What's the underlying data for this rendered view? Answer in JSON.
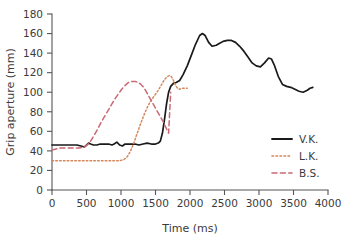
{
  "chart_data": {
    "type": "line",
    "title": "",
    "xlabel": "Time (ms)",
    "ylabel": "Grip aperture (mm)",
    "xlim": [
      0,
      4000
    ],
    "ylim": [
      0,
      180
    ],
    "xticks": [
      0,
      500,
      1000,
      1500,
      2000,
      2500,
      3000,
      3500,
      4000
    ],
    "yticks": [
      0,
      20,
      40,
      60,
      80,
      100,
      120,
      140,
      160,
      180
    ],
    "grid": false,
    "legend_position": "lower right",
    "series": [
      {
        "name": "V.K.",
        "color": "#1a1a1a",
        "style": "solid",
        "x": [
          0,
          60,
          120,
          200,
          280,
          360,
          420,
          470,
          500,
          530,
          560,
          600,
          650,
          700,
          760,
          820,
          870,
          900,
          940,
          980,
          1020,
          1060,
          1100,
          1150,
          1200,
          1260,
          1320,
          1380,
          1440,
          1500,
          1540,
          1570,
          1600,
          1630,
          1660,
          1690,
          1720,
          1760,
          1800,
          1850,
          1900,
          1960,
          2020,
          2080,
          2140,
          2180,
          2220,
          2270,
          2320,
          2380,
          2430,
          2480,
          2540,
          2600,
          2660,
          2720,
          2780,
          2840,
          2900,
          2960,
          3020,
          3080,
          3140,
          3180,
          3220,
          3280,
          3340,
          3400,
          3460,
          3520,
          3580,
          3640,
          3700,
          3740,
          3780
        ],
        "y": [
          46,
          46,
          46,
          46,
          46,
          46,
          45,
          44,
          46,
          48,
          47,
          46,
          46,
          47,
          47,
          47,
          46,
          47,
          49,
          46,
          45,
          47,
          47,
          47,
          47,
          46,
          47,
          48,
          47,
          47,
          48,
          50,
          58,
          72,
          88,
          100,
          106,
          109,
          110,
          112,
          118,
          127,
          138,
          149,
          158,
          160,
          158,
          151,
          147,
          148,
          150,
          152,
          153,
          153,
          151,
          147,
          142,
          136,
          130,
          127,
          126,
          130,
          135,
          134,
          128,
          116,
          108,
          106,
          105,
          103,
          101,
          100,
          102,
          104,
          105
        ]
      },
      {
        "name": "L.K.",
        "color": "#d4885c",
        "style": "dotted",
        "x": [
          0,
          100,
          200,
          300,
          400,
          500,
          600,
          700,
          800,
          900,
          980,
          1040,
          1090,
          1140,
          1190,
          1240,
          1290,
          1340,
          1390,
          1440,
          1490,
          1540,
          1590,
          1630,
          1670,
          1700,
          1730,
          1760,
          1790,
          1820,
          1850,
          1880,
          1910,
          1940,
          1960
        ],
        "y": [
          30,
          30,
          30,
          30,
          30,
          30,
          30,
          30,
          30,
          30,
          30,
          31,
          34,
          40,
          49,
          59,
          69,
          78,
          86,
          92,
          97,
          102,
          108,
          113,
          116,
          117,
          116,
          112,
          107,
          104,
          103,
          104,
          104,
          104,
          104
        ]
      },
      {
        "name": "B.S.",
        "color": "#c96a74",
        "style": "dashed",
        "x": [
          0,
          60,
          120,
          190,
          260,
          330,
          400,
          460,
          510,
          560,
          610,
          660,
          710,
          760,
          810,
          860,
          910,
          960,
          1010,
          1060,
          1110,
          1160,
          1210,
          1250,
          1290,
          1330,
          1370,
          1410,
          1450,
          1490,
          1530,
          1570,
          1610,
          1650,
          1690,
          1720
        ],
        "y": [
          41,
          42,
          43,
          43,
          43,
          43,
          43,
          44,
          46,
          50,
          56,
          62,
          69,
          75,
          81,
          87,
          93,
          98,
          103,
          107,
          110,
          111,
          111,
          110,
          108,
          105,
          100,
          95,
          90,
          85,
          80,
          75,
          70,
          64,
          58,
          100
        ]
      }
    ]
  },
  "legend": {
    "items": [
      {
        "label": "V.K.",
        "style": "solid"
      },
      {
        "label": "L.K.",
        "style": "dotted"
      },
      {
        "label": "B.S.",
        "style": "dashed"
      }
    ]
  }
}
